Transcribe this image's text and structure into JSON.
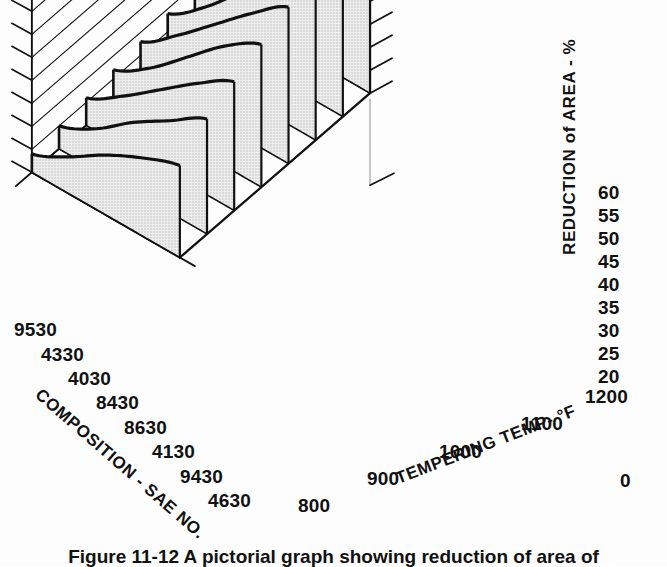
{
  "figure": {
    "caption": "Figure  11-12 A pictorial graph showing reduction of area of",
    "background": "#fdfdfd",
    "ink": "#111111",
    "panel_fill": "#d7d7d7"
  },
  "chart_data": {
    "type": "area",
    "title": "",
    "projection": "3d-isometric-ribbon",
    "zlabel": "REDUCTION of AREA - %",
    "zlim": [
      20,
      60
    ],
    "zticks": [
      20,
      25,
      30,
      35,
      40,
      45,
      50,
      55,
      60
    ],
    "ztick_labels": [
      "20",
      "25",
      "30",
      "35",
      "40",
      "45",
      "50",
      "55",
      "60"
    ],
    "z_origin_label": "0",
    "xlabel": "TEMPERING TEMP- °F",
    "xticks": [
      800,
      900,
      1000,
      1100,
      1200
    ],
    "xtick_labels": [
      "800",
      "900",
      "1000",
      "1100",
      "1200"
    ],
    "x_minor_step": 50,
    "ylabel": "COMPOSITION - SAE NO.",
    "categories": [
      "9530",
      "4330",
      "4030",
      "8430",
      "8630",
      "4130",
      "9430",
      "4630"
    ],
    "grid": true,
    "legend": "none",
    "series": [
      {
        "name": "9530",
        "x": [
          800,
          900,
          1000,
          1100,
          1200
        ],
        "values": [
          31,
          38,
          47,
          55,
          61
        ]
      },
      {
        "name": "4330",
        "x": [
          800,
          900,
          1000,
          1100,
          1200
        ],
        "values": [
          30,
          37,
          45,
          53,
          59
        ]
      },
      {
        "name": "4030",
        "x": [
          800,
          900,
          1000,
          1100,
          1200
        ],
        "values": [
          29,
          35,
          43,
          51,
          57
        ]
      },
      {
        "name": "8430",
        "x": [
          800,
          900,
          1000,
          1100,
          1200
        ],
        "values": [
          28,
          34,
          41,
          48,
          54
        ]
      },
      {
        "name": "8630",
        "x": [
          800,
          900,
          1000,
          1100,
          1200
        ],
        "values": [
          27,
          32,
          39,
          46,
          51
        ]
      },
      {
        "name": "4130",
        "x": [
          800,
          900,
          1000,
          1100,
          1200
        ],
        "values": [
          26,
          31,
          37,
          43,
          48
        ]
      },
      {
        "name": "9430",
        "x": [
          800,
          900,
          1000,
          1100,
          1200
        ],
        "values": [
          25,
          29,
          35,
          40,
          45
        ]
      },
      {
        "name": "4630",
        "x": [
          800,
          900,
          1000,
          1100,
          1200
        ],
        "values": [
          24,
          28,
          33,
          37,
          40
        ]
      }
    ]
  },
  "axes": {
    "z_axis_title": "REDUCTION of AREA - %",
    "x_axis_title": "TEMPERING TEMP- °F",
    "y_axis_title": "COMPOSITION - SAE NO.",
    "z_ticks": [
      "60",
      "55",
      "50",
      "45",
      "40",
      "35",
      "30",
      "25",
      "20"
    ],
    "zero_label": "0",
    "x_ticks": [
      "800",
      "900",
      "1000",
      "1100",
      "1200"
    ],
    "y_ticks": [
      "9530",
      "4330",
      "4030",
      "8430",
      "8630",
      "4130",
      "9430",
      "4630"
    ]
  }
}
